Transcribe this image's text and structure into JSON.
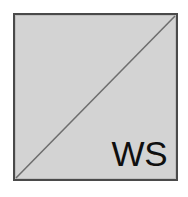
{
  "figure": {
    "kind": "square-with-diagonal",
    "label": "WS",
    "colors": {
      "page_background": "#ffffff",
      "square_fill": "#d3d3d3",
      "square_border": "#4a4a4a",
      "diagonal_line": "#6e6e6e",
      "label_text": "#0f0f0f"
    },
    "geometry": {
      "square_left": 13,
      "square_top": 13,
      "square_width": 165,
      "square_height": 168,
      "border_width": 2,
      "diagonal_from": "bottom-left",
      "diagonal_to": "top-right",
      "diagonal_width": 1.6
    },
    "label_position": "bottom-right-inside",
    "label_font_size": 35
  }
}
